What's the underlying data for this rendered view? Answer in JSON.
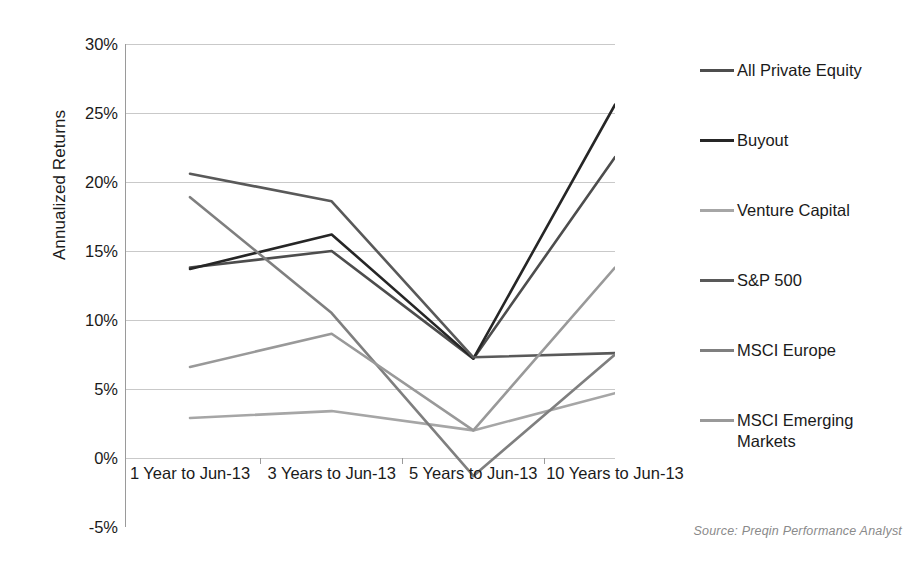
{
  "chart_data": {
    "type": "line",
    "title": "",
    "xlabel": "",
    "ylabel": "Annualized Returns",
    "categories": [
      "1 Year to Jun-13",
      "3 Years to Jun-13",
      "5 Years to Jun-13",
      "10 Years to Jun-13"
    ],
    "ylim": [
      -5,
      30
    ],
    "yticks": [
      -5,
      0,
      5,
      10,
      15,
      20,
      25,
      30
    ],
    "ytick_labels": [
      "-5%",
      "0%",
      "5%",
      "10%",
      "15%",
      "20%",
      "25%",
      "30%"
    ],
    "grid": true,
    "legend_position": "right",
    "series": [
      {
        "name": "All Private Equity",
        "color": "#4d4d4d",
        "values": [
          13.8,
          15.0,
          7.2,
          21.8
        ]
      },
      {
        "name": "Buyout",
        "color": "#262626",
        "values": [
          13.7,
          16.2,
          7.2,
          25.6
        ]
      },
      {
        "name": "Venture Capital",
        "color": "#a6a6a6",
        "values": [
          2.9,
          3.4,
          2.0,
          4.7
        ]
      },
      {
        "name": "S&P 500",
        "color": "#595959",
        "values": [
          20.6,
          18.6,
          7.3,
          7.6
        ]
      },
      {
        "name": "MSCI Europe",
        "color": "#7f7f7f",
        "values": [
          18.9,
          10.5,
          -1.3,
          7.5
        ]
      },
      {
        "name": "MSCI Emerging Markets",
        "color": "#999999",
        "values": [
          6.6,
          9.0,
          2.0,
          13.8
        ]
      }
    ],
    "annotations": [
      "Source: Preqin Performance Analyst"
    ]
  },
  "source_note": "Source: Preqin Performance Analyst"
}
